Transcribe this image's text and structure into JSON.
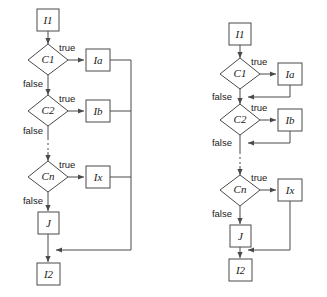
{
  "figure": {
    "background_color": "#ffffff",
    "stroke_color": "#4a4a4a",
    "text_color": "#1a1a1a"
  },
  "labels": {
    "true": "true",
    "false": "false"
  },
  "diagrams": [
    {
      "id": "left",
      "name": "shared-exit-variant",
      "nodes": {
        "start": "I1",
        "c1": "C1",
        "c2": "C2",
        "cn": "Cn",
        "ia": "Ia",
        "ib": "Ib",
        "ix": "Ix",
        "j": "J",
        "end": "I2"
      },
      "edge_labels": {
        "c1_true": "true",
        "c1_false": "false",
        "c2_true": "true",
        "c2_false": "false",
        "cn_true": "true",
        "cn_false": "false"
      }
    },
    {
      "id": "right",
      "name": "immediate-rejoin-variant",
      "nodes": {
        "start": "I1",
        "c1": "C1",
        "c2": "C2",
        "cn": "Cn",
        "ia": "Ia",
        "ib": "Ib",
        "ix": "Ix",
        "j": "J",
        "end": "I2"
      },
      "edge_labels": {
        "c1_true": "true",
        "c1_false": "false",
        "c2_true": "true",
        "c2_false": "false",
        "cn_true": "true",
        "cn_false": "false"
      }
    }
  ]
}
